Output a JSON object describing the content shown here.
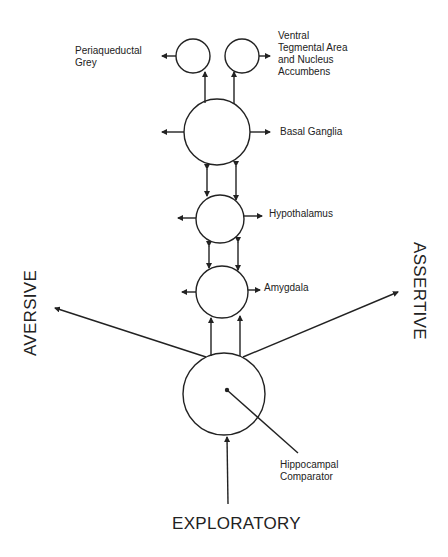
{
  "diagram": {
    "nodes": {
      "pag": {
        "label_lines": [
          "Periaqueductal",
          "Grey"
        ]
      },
      "vta": {
        "label_lines": [
          "Ventral",
          "Tegmental Area",
          "and Nucleus",
          "Accumbens"
        ]
      },
      "basal_ganglia": {
        "label": "Basal Ganglia"
      },
      "hypothalamus": {
        "label": "Hypothalamus"
      },
      "amygdala": {
        "label": "Amygdala"
      },
      "hippocampal": {
        "label_lines": [
          "Hippocampal",
          "Comparator"
        ]
      }
    },
    "axes": {
      "left": "AVERSIVE",
      "right": "ASSERTIVE",
      "bottom": "EXPLORATORY"
    },
    "colors": {
      "stroke": "#222222",
      "background": "#ffffff"
    }
  }
}
